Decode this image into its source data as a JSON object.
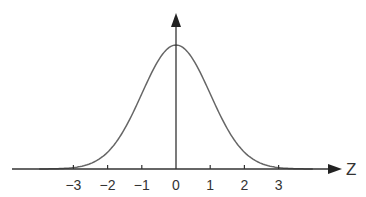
{
  "chart_data": {
    "type": "line",
    "title": "",
    "xlabel": "Z",
    "ylabel": "",
    "x_ticks": [
      -3,
      -2,
      -1,
      0,
      1,
      2,
      3
    ],
    "tick_labels": [
      "−3",
      "−2",
      "−1",
      "0",
      "1",
      "2",
      "3"
    ],
    "xlim": [
      -4.5,
      4.8
    ],
    "grid": false,
    "legend": null,
    "series": [
      {
        "name": "standard normal density",
        "mean": 0,
        "std": 1
      }
    ]
  },
  "colors": {
    "axis": "#333333",
    "curve": "#666666",
    "background": "#ffffff"
  }
}
